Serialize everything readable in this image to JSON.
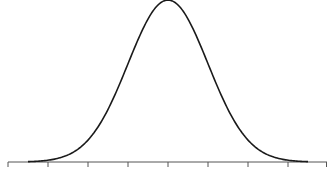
{
  "chart_data": {
    "type": "line",
    "title": "",
    "xlabel": "",
    "ylabel": "",
    "series": [
      {
        "name": "normal-distribution",
        "mean": 0,
        "std": 1,
        "x_range": [
          -3.5,
          3.5
        ]
      }
    ],
    "x_ticks": [
      -4,
      -3,
      -2,
      -1,
      0,
      1,
      2,
      3,
      4
    ],
    "tick_labels_visible": false,
    "grid": false,
    "legend": null,
    "colors": {
      "curve": "#1a1a1a",
      "axis": "#555555",
      "background": "#ffffff"
    }
  }
}
